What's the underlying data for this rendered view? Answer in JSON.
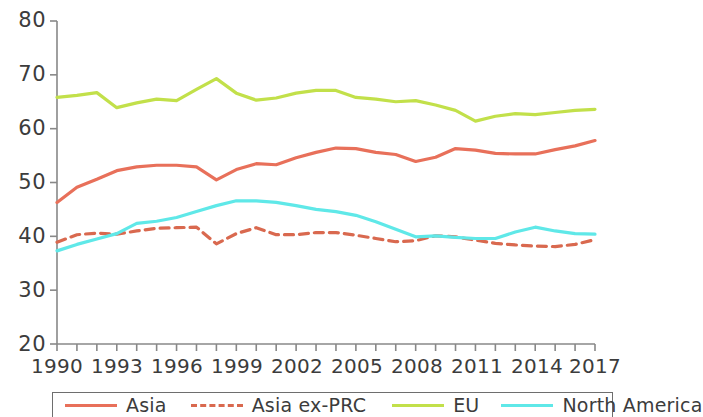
{
  "chart_data": {
    "type": "line",
    "title": "",
    "subtitle": "",
    "xlabel": "",
    "ylabel": "",
    "xlim": [
      1990,
      2017
    ],
    "ylim": [
      20,
      80
    ],
    "yticks": [
      20,
      30,
      40,
      50,
      60,
      70,
      80
    ],
    "ytick_labels": [
      "20",
      "30",
      "40",
      "50",
      "60",
      "70",
      "80"
    ],
    "xticks": [
      1990,
      1991,
      1992,
      1993,
      1994,
      1995,
      1996,
      1997,
      1998,
      1999,
      2000,
      2001,
      2002,
      2003,
      2004,
      2005,
      2006,
      2007,
      2008,
      2009,
      2010,
      2011,
      2012,
      2013,
      2014,
      2015,
      2016,
      2017
    ],
    "xtick_labels": [
      "1990",
      "1993",
      "1996",
      "1999",
      "2002",
      "2005",
      "2008",
      "2011",
      "2014",
      "2017"
    ],
    "xtick_labeled_years": [
      1990,
      1993,
      1996,
      1999,
      2002,
      2005,
      2008,
      2011,
      2014,
      2017
    ],
    "grid": false,
    "legend_position": "bottom",
    "x": [
      1990,
      1991,
      1992,
      1993,
      1994,
      1995,
      1996,
      1997,
      1998,
      1999,
      2000,
      2001,
      2002,
      2003,
      2004,
      2005,
      2006,
      2007,
      2008,
      2009,
      2010,
      2011,
      2012,
      2013,
      2014,
      2015,
      2016,
      2017
    ],
    "series": [
      {
        "name": "Asia",
        "color": "#e8705a",
        "style": "solid",
        "values": [
          46.3,
          49.1,
          50.6,
          52.2,
          52.9,
          53.2,
          53.2,
          52.9,
          50.5,
          52.4,
          53.5,
          53.3,
          54.6,
          55.6,
          56.4,
          56.3,
          55.6,
          55.2,
          53.9,
          54.7,
          56.3,
          56.0,
          55.4,
          55.3,
          55.3,
          56.1,
          56.8,
          57.8
        ]
      },
      {
        "name": "Asia ex-PRC",
        "color": "#d9694f",
        "style": "dashed",
        "values": [
          38.9,
          40.3,
          40.6,
          40.4,
          41.0,
          41.5,
          41.6,
          41.7,
          38.6,
          40.5,
          41.6,
          40.3,
          40.3,
          40.7,
          40.7,
          40.2,
          39.6,
          39.0,
          39.2,
          40.1,
          39.9,
          39.3,
          38.7,
          38.4,
          38.2,
          38.1,
          38.5,
          39.4
        ]
      },
      {
        "name": "EU",
        "color": "#c2e04a",
        "style": "solid",
        "values": [
          65.8,
          66.2,
          66.7,
          63.9,
          64.8,
          65.5,
          65.2,
          67.3,
          69.3,
          66.6,
          65.3,
          65.7,
          66.6,
          67.1,
          67.1,
          65.8,
          65.5,
          65.0,
          65.2,
          64.4,
          63.4,
          61.4,
          62.3,
          62.8,
          62.6,
          63.0,
          63.4,
          63.6
        ]
      },
      {
        "name": "North America",
        "color": "#5fe8e8",
        "style": "solid",
        "values": [
          37.3,
          38.5,
          39.5,
          40.5,
          42.4,
          42.8,
          43.5,
          44.6,
          45.7,
          46.6,
          46.6,
          46.3,
          45.7,
          45.0,
          44.6,
          43.9,
          42.7,
          41.3,
          39.9,
          40.1,
          39.8,
          39.6,
          39.6,
          40.8,
          41.7,
          41.0,
          40.5,
          40.4
        ]
      }
    ]
  },
  "legend": {
    "items": [
      {
        "label": "Asia",
        "color": "#e8705a",
        "style": "solid"
      },
      {
        "label": "Asia ex-PRC",
        "color": "#d9694f",
        "style": "dashed"
      },
      {
        "label": "EU",
        "color": "#c2e04a",
        "style": "solid"
      },
      {
        "label": "North America",
        "color": "#5fe8e8",
        "style": "solid"
      }
    ]
  },
  "axis": {
    "color": "#888888"
  }
}
